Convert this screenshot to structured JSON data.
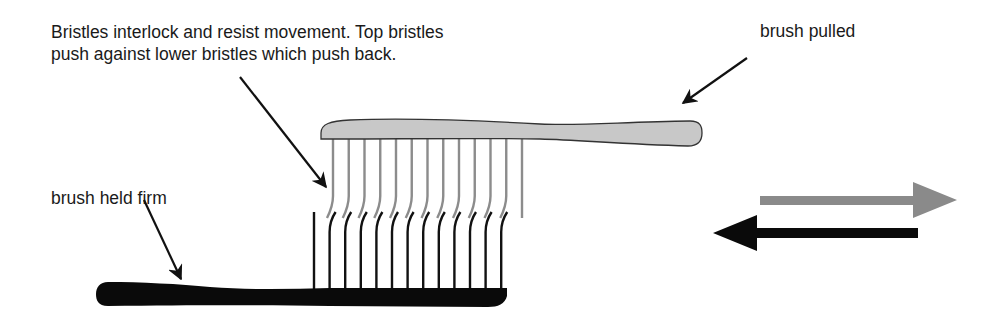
{
  "labels": {
    "main_line1": "Bristles interlock and resist movement. Top bristles",
    "main_line2": "push against lower bristles which push back.",
    "brush_pulled": "brush pulled",
    "brush_held_firm": "brush held firm"
  },
  "brushes": {
    "top": {
      "role": "brush pulled",
      "color": "#c8c8c8",
      "outline": "#333333",
      "bristle_color": "#8c8c8c",
      "bristle_count": 13
    },
    "bottom": {
      "role": "brush held firm",
      "color": "#0a0a0a",
      "bristle_color": "#111111",
      "bristle_count": 13
    }
  },
  "motion_arrows": [
    {
      "name": "pull-direction",
      "direction": "right",
      "color": "#8a8a8a"
    },
    {
      "name": "resist-direction",
      "direction": "left",
      "color": "#0a0a0a"
    }
  ]
}
